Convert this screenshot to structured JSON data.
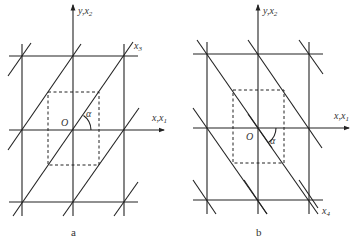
{
  "figure": {
    "panel_a": {
      "caption": "a",
      "y_axis_label": "y,x",
      "y_axis_sub": "2",
      "x_axis_label": "x,x",
      "x_axis_sub": "1",
      "diag_label": "x",
      "diag_sub": "3",
      "origin_label": "O",
      "angle_label": "α"
    },
    "panel_b": {
      "caption": "b",
      "y_axis_label": "y,x",
      "y_axis_sub": "2",
      "x_axis_label": "x,x",
      "x_axis_sub": "1",
      "diag_label": "x",
      "diag_sub": "4",
      "origin_label": "O",
      "angle_label": "α"
    },
    "colors": {
      "line": "#222222",
      "text": "#333333",
      "background": "#ffffff"
    }
  }
}
